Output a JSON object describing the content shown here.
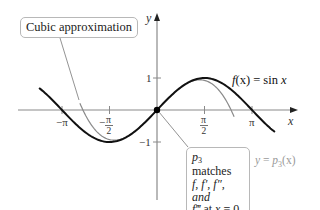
{
  "figure": {
    "colors": {
      "sin_curve": "#111111",
      "cubic_curve": "#8a8a8a",
      "axes": "#8a8a8a",
      "point": "#000000",
      "callout_border": "#b8b8b8",
      "cubic_label": "#9a9a9a"
    },
    "axes": {
      "x_label": "x",
      "y_label": "y",
      "x_ticks": [
        "−π",
        "−π/2",
        "π/2",
        "π"
      ],
      "x_tick_labels": {
        "neg_pi": "−π",
        "neg_half_pi_num": "π",
        "neg_half_pi_sign": "−",
        "neg_half_pi_den": "2",
        "half_pi_num": "π",
        "half_pi_den": "2",
        "pi": "π"
      },
      "y_ticks": [
        "1",
        "−1"
      ],
      "y_tick_labels": {
        "one": "1",
        "neg_one": "−1"
      }
    },
    "curves": {
      "sin_label": "f(x) = sin x",
      "sin_label_parts": {
        "f": "f",
        "args": "(x)",
        "eq": " = sin ",
        "x": "x"
      },
      "cubic_label_parts": {
        "y": "y",
        "eq": " = ",
        "p": "p",
        "sub": "3",
        "args": "(x)"
      }
    },
    "callouts": {
      "top": {
        "text": "Cubic approximation"
      },
      "bottom": {
        "line1_p": "p",
        "line1_sub": "3",
        "line1_rest": " matches",
        "line2": "f, f′, f″, and",
        "line3_f": "f‴",
        "line3_rest": " at ",
        "line3_x": "x",
        "line3_end": " = 0."
      }
    }
  },
  "chart_data": {
    "type": "line",
    "title": "",
    "xlabel": "x",
    "ylabel": "y",
    "xlim": [
      -3.9,
      4.3
    ],
    "ylim": [
      -2.9,
      2.9
    ],
    "x_ticks": [
      {
        "value": -3.14159,
        "label": "−π"
      },
      {
        "value": -1.5708,
        "label": "−π/2"
      },
      {
        "value": 1.5708,
        "label": "π/2"
      },
      {
        "value": 3.14159,
        "label": "π"
      }
    ],
    "y_ticks": [
      {
        "value": 1,
        "label": "1"
      },
      {
        "value": -1,
        "label": "−1"
      }
    ],
    "grid": false,
    "series": [
      {
        "name": "f(x) = sin x",
        "formula": "sin(x)",
        "x_range": [
          -3.9,
          3.9
        ],
        "color": "#111111",
        "width": 2
      },
      {
        "name": "y = p3(x)",
        "formula": "x - x^3/6",
        "x_range": [
          -2.55,
          2.55
        ],
        "color": "#8a8a8a",
        "width": 1.2
      }
    ],
    "points": [
      {
        "x": 0,
        "y": 0,
        "label": "origin"
      }
    ],
    "annotations": [
      "Cubic approximation",
      "p3 matches f, f′, f″, and f‴ at x = 0.",
      "f(x) = sin x",
      "y = p3(x)"
    ]
  }
}
